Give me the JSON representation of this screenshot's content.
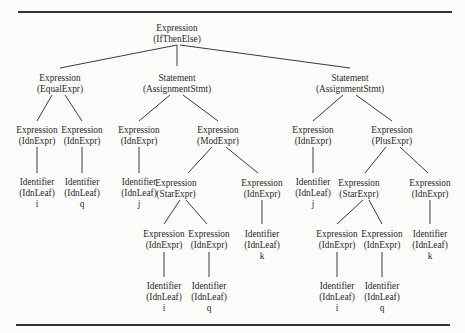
{
  "diagram": {
    "type": "parse-tree",
    "nodes": [
      {
        "id": "n0",
        "kind": "Expression",
        "cls": "(IfThenElse)",
        "value": "",
        "x": 177,
        "y": 23
      },
      {
        "id": "n1",
        "kind": "Expression",
        "cls": "(EqualExpr)",
        "value": "",
        "x": 60,
        "y": 73
      },
      {
        "id": "n2",
        "kind": "Statement",
        "cls": "(AssignmentStmt)",
        "value": "",
        "x": 177,
        "y": 73
      },
      {
        "id": "n3",
        "kind": "Statement",
        "cls": "(AssignmentStmt)",
        "value": "",
        "x": 350,
        "y": 73
      },
      {
        "id": "n4",
        "kind": "Expression",
        "cls": "(IdnExpr)",
        "value": "",
        "x": 37,
        "y": 125
      },
      {
        "id": "n5",
        "kind": "Expression",
        "cls": "(IdnExpr)",
        "value": "",
        "x": 82,
        "y": 125
      },
      {
        "id": "n6",
        "kind": "Expression",
        "cls": "(IdnExpr)",
        "value": "",
        "x": 139,
        "y": 125
      },
      {
        "id": "n7",
        "kind": "Expression",
        "cls": "(ModExpr)",
        "value": "",
        "x": 218,
        "y": 125
      },
      {
        "id": "n8",
        "kind": "Expression",
        "cls": "(IdnExpr)",
        "value": "",
        "x": 313,
        "y": 125
      },
      {
        "id": "n9",
        "kind": "Expression",
        "cls": "(PlusExpr)",
        "value": "",
        "x": 392,
        "y": 125
      },
      {
        "id": "n10",
        "kind": "Identifier",
        "cls": "(IdnLeaf)",
        "value": "i",
        "x": 37,
        "y": 177
      },
      {
        "id": "n11",
        "kind": "Identifier",
        "cls": "(IdnLeaf)",
        "value": "q",
        "x": 82,
        "y": 177
      },
      {
        "id": "n12",
        "kind": "Identifier",
        "cls": "(IdnLeaf)",
        "value": "j",
        "x": 139,
        "y": 177
      },
      {
        "id": "n13",
        "kind": "Expression",
        "cls": "(StarExpr)",
        "value": "",
        "x": 176,
        "y": 178
      },
      {
        "id": "n14",
        "kind": "Expression",
        "cls": "(IdnExpr)",
        "value": "",
        "x": 262,
        "y": 178
      },
      {
        "id": "n15",
        "kind": "Identifier",
        "cls": "(IdnLeaf)",
        "value": "j",
        "x": 313,
        "y": 177
      },
      {
        "id": "n16",
        "kind": "Expression",
        "cls": "(StarExpr)",
        "value": "",
        "x": 359,
        "y": 178
      },
      {
        "id": "n17",
        "kind": "Expression",
        "cls": "(IdnExpr)",
        "value": "",
        "x": 430,
        "y": 178
      },
      {
        "id": "n18",
        "kind": "Expression",
        "cls": "(IdnExpr)",
        "value": "",
        "x": 164,
        "y": 229
      },
      {
        "id": "n19",
        "kind": "Expression",
        "cls": "(IdnExpr)",
        "value": "",
        "x": 209,
        "y": 229
      },
      {
        "id": "n20",
        "kind": "Identifier",
        "cls": "(IdnLeaf)",
        "value": "k",
        "x": 262,
        "y": 229
      },
      {
        "id": "n21",
        "kind": "Expression",
        "cls": "(IdnExpr)",
        "value": "",
        "x": 337,
        "y": 229
      },
      {
        "id": "n22",
        "kind": "Expression",
        "cls": "(IdnExpr)",
        "value": "",
        "x": 382,
        "y": 229
      },
      {
        "id": "n23",
        "kind": "Identifier",
        "cls": "(IdnLeaf)",
        "value": "k",
        "x": 430,
        "y": 229
      },
      {
        "id": "n24",
        "kind": "Identifier",
        "cls": "(IdnLeaf)",
        "value": "i",
        "x": 164,
        "y": 281
      },
      {
        "id": "n25",
        "kind": "Identifier",
        "cls": "(IdnLeaf)",
        "value": "q",
        "x": 209,
        "y": 281
      },
      {
        "id": "n26",
        "kind": "Identifier",
        "cls": "(IdnLeaf)",
        "value": "i",
        "x": 337,
        "y": 281
      },
      {
        "id": "n27",
        "kind": "Identifier",
        "cls": "(IdnLeaf)",
        "value": "q",
        "x": 382,
        "y": 281
      }
    ],
    "edges": [
      [
        177,
        45,
        60,
        68
      ],
      [
        177,
        45,
        177,
        66
      ],
      [
        180,
        45,
        350,
        68
      ],
      [
        52,
        95,
        37,
        121
      ],
      [
        65,
        95,
        82,
        121
      ],
      [
        170,
        95,
        139,
        121
      ],
      [
        183,
        95,
        218,
        121
      ],
      [
        343,
        95,
        313,
        121
      ],
      [
        356,
        95,
        392,
        121
      ],
      [
        37,
        147,
        37,
        173
      ],
      [
        82,
        147,
        82,
        173
      ],
      [
        139,
        147,
        139,
        173
      ],
      [
        212,
        147,
        188,
        173
      ],
      [
        226,
        147,
        258,
        173
      ],
      [
        313,
        147,
        313,
        173
      ],
      [
        386,
        147,
        365,
        173
      ],
      [
        400,
        147,
        428,
        173
      ],
      [
        180,
        200,
        164,
        224
      ],
      [
        186,
        200,
        207,
        224
      ],
      [
        262,
        200,
        262,
        224
      ],
      [
        363,
        200,
        337,
        224
      ],
      [
        369,
        200,
        382,
        224
      ],
      [
        430,
        200,
        430,
        224
      ],
      [
        164,
        252,
        164,
        277
      ],
      [
        209,
        252,
        209,
        277
      ],
      [
        337,
        252,
        337,
        277
      ],
      [
        382,
        252,
        382,
        277
      ]
    ],
    "rules": [
      {
        "x": 18,
        "y": 11,
        "width": 434
      },
      {
        "x": 16,
        "y": 324,
        "width": 434
      }
    ]
  }
}
